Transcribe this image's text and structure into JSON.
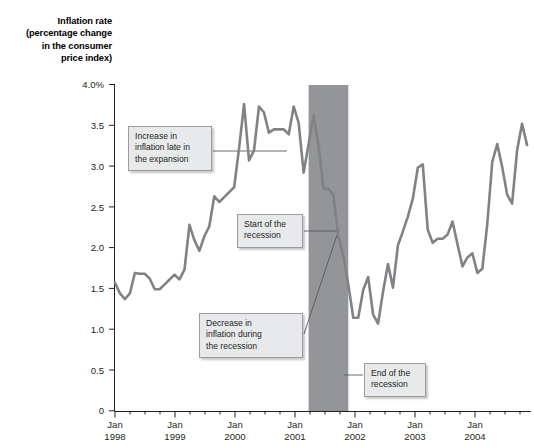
{
  "chart_data": {
    "type": "line",
    "title": "Inflation rate (percentage change in the consumer price index)",
    "title_lines": [
      "Inflation rate",
      "(percentage change",
      "in the consumer",
      "price index)"
    ],
    "xlabel": "",
    "ylabel": "Inflation rate (percentage change in the consumer price index)",
    "ylim": [
      0,
      4.0
    ],
    "yticks": [
      0,
      0.5,
      1.0,
      1.5,
      2.0,
      2.5,
      3.0,
      3.5,
      4.0
    ],
    "ytick_labels": [
      "0",
      "0.5",
      "1.0",
      "1.5",
      "2.0",
      "2.5",
      "3.0",
      "3.5",
      "4.0%"
    ],
    "xlim": [
      "1998-01",
      "2004-12"
    ],
    "xticks": [
      "1998-01",
      "1999-01",
      "2000-01",
      "2001-01",
      "2002-01",
      "2003-01",
      "2004-01"
    ],
    "xtick_labels": [
      {
        "month": "Jan",
        "year": "1998"
      },
      {
        "month": "Jan",
        "year": "1999"
      },
      {
        "month": "Jan",
        "year": "2000"
      },
      {
        "month": "Jan",
        "year": "2001"
      },
      {
        "month": "Jan",
        "year": "2002"
      },
      {
        "month": "Jan",
        "year": "2003"
      },
      {
        "month": "Jan",
        "year": "2004"
      }
    ],
    "grid": false,
    "legend": "none",
    "line_color": "#808285",
    "shaded_region": {
      "label": "recession",
      "start": "2001-04",
      "end": "2001-12",
      "color": "#939598"
    },
    "series": [
      {
        "name": "Inflation rate",
        "color": "#808285",
        "x": [
          "1998-01",
          "1998-02",
          "1998-03",
          "1998-04",
          "1998-05",
          "1998-06",
          "1998-07",
          "1998-08",
          "1998-09",
          "1998-10",
          "1998-11",
          "1998-12",
          "1999-01",
          "1999-02",
          "1999-03",
          "1999-04",
          "1999-05",
          "1999-06",
          "1999-07",
          "1999-08",
          "1999-09",
          "1999-10",
          "1999-11",
          "1999-12",
          "2000-01",
          "2000-02",
          "2000-03",
          "2000-04",
          "2000-05",
          "2000-06",
          "2000-07",
          "2000-08",
          "2000-09",
          "2000-10",
          "2000-11",
          "2000-12",
          "2001-01",
          "2001-02",
          "2001-03",
          "2001-04",
          "2001-05",
          "2001-06",
          "2001-07",
          "2001-08",
          "2001-09",
          "2001-10",
          "2001-11",
          "2001-12",
          "2002-01",
          "2002-02",
          "2002-03",
          "2002-04",
          "2002-05",
          "2002-06",
          "2002-07",
          "2002-08",
          "2002-09",
          "2002-10",
          "2002-11",
          "2002-12",
          "2003-01",
          "2003-02",
          "2003-03",
          "2003-04",
          "2003-05",
          "2003-06",
          "2003-07",
          "2003-08",
          "2003-09",
          "2003-10",
          "2003-11",
          "2003-12",
          "2004-01",
          "2004-02",
          "2004-03",
          "2004-04",
          "2004-05",
          "2004-06",
          "2004-07",
          "2004-08",
          "2004-09",
          "2004-10",
          "2004-11",
          "2004-12"
        ],
        "values": [
          1.57,
          1.44,
          1.37,
          1.44,
          1.69,
          1.68,
          1.68,
          1.62,
          1.49,
          1.49,
          1.55,
          1.61,
          1.67,
          1.61,
          1.73,
          2.28,
          2.09,
          1.96,
          2.14,
          2.26,
          2.63,
          2.56,
          2.62,
          2.68,
          2.74,
          3.22,
          3.76,
          3.07,
          3.19,
          3.73,
          3.66,
          3.41,
          3.45,
          3.45,
          3.45,
          3.39,
          3.73,
          3.53,
          2.92,
          3.27,
          3.62,
          3.25,
          2.72,
          2.72,
          2.65,
          2.13,
          1.9,
          1.55,
          1.14,
          1.14,
          1.48,
          1.64,
          1.18,
          1.07,
          1.46,
          1.8,
          1.51,
          2.03,
          2.2,
          2.38,
          2.6,
          2.98,
          3.02,
          2.22,
          2.06,
          2.11,
          2.11,
          2.16,
          2.32,
          2.04,
          1.77,
          1.88,
          1.93,
          1.69,
          1.74,
          2.29,
          3.05,
          3.27,
          2.99,
          2.65,
          2.54,
          3.19,
          3.52,
          3.26
        ]
      }
    ],
    "annotations": [
      {
        "id": "increase",
        "text": "Increase in\ninflation late in\nthe expansion",
        "points_to": "2000-01"
      },
      {
        "id": "start",
        "text": "Start of the\nrecession",
        "points_to": "2001-04"
      },
      {
        "id": "decrease",
        "text": "Decrease in\ninflation during\nthe recession",
        "points_to": "2001-08"
      },
      {
        "id": "end",
        "text": "End of the\nrecession",
        "points_to": "2001-12"
      }
    ]
  }
}
